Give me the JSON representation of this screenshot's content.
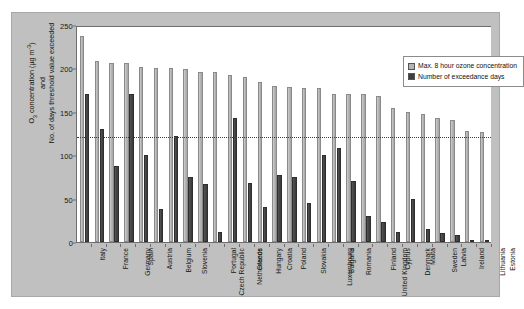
{
  "chart_data": {
    "type": "bar",
    "title": "",
    "xlabel": "",
    "ylabel_lines": [
      "O3 concentration (µg m-3)",
      "and",
      "No. of days threshold value exceeded"
    ],
    "ylabel_parts": {
      "o": "O",
      "sub3": "3",
      "concentration": " concentration (µg m",
      "sup": "-3",
      "closing": ")",
      "and": "and",
      "days": "No. of days threshold value exceeded"
    },
    "ylim": [
      0,
      250
    ],
    "yticks": [
      0,
      50,
      100,
      150,
      200,
      250
    ],
    "ytick_labels": [
      "0",
      "50",
      "100",
      "150",
      "200",
      "250"
    ],
    "grid": false,
    "legend_position": "upper-right-inside",
    "threshold": {
      "value": 120,
      "style": "dotted",
      "label": ""
    },
    "categories": [
      "Italy",
      "France",
      "Germany",
      "Spain",
      "Austria",
      "Belgium",
      "Slovenia",
      "Czech Republic",
      "Portugal",
      "Netherlands",
      "Greece",
      "Hungary",
      "Croatia",
      "Poland",
      "Slovakia",
      "Luxembourg",
      "Bulgaria",
      "Romania",
      "United Kingdom",
      "Finland",
      "Cyprus",
      "Denmark",
      "Malta",
      "Sweden",
      "Latvia",
      "Ireland",
      "Lithuania",
      "Estonia"
    ],
    "series": [
      {
        "name": "Max. 8 hour ozone concentration",
        "color": "#b4b4b4",
        "values": [
          237,
          208,
          206,
          206,
          202,
          201,
          200,
          199,
          196,
          196,
          192,
          190,
          184,
          180,
          179,
          178,
          177,
          170,
          170,
          170,
          168,
          154,
          150,
          148,
          143,
          140,
          128,
          127
        ]
      },
      {
        "name": "Number of exceedance days",
        "color": "#3f3f3f",
        "values": [
          170,
          130,
          88,
          170,
          100,
          38,
          122,
          75,
          67,
          12,
          143,
          68,
          40,
          77,
          75,
          45,
          100,
          108,
          70,
          30,
          23,
          12,
          50,
          15,
          10,
          8,
          2,
          2
        ]
      }
    ]
  },
  "legend": {
    "entries": [
      {
        "label": "Max. 8 hour ozone concentration"
      },
      {
        "label": "Number of exceedance days"
      }
    ]
  }
}
